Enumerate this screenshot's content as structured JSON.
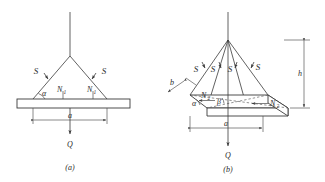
{
  "figure": {
    "background_color": "#ffffff",
    "ink_color": "#3a3a3a",
    "panels": [
      {
        "caption": "(a)",
        "description": "Two-dimensional free body diagram of a plate suspended by two ropes",
        "labels": {
          "tension_left": "S",
          "tension_right": "S",
          "normal_left": "N",
          "normal_left_sub": "1",
          "normal_right": "N",
          "normal_right_sub": "1",
          "angle_alpha": "α",
          "width_dim": "a",
          "weight": "Q"
        }
      },
      {
        "caption": "(b)",
        "description": "Three-dimensional free body diagram of a rectangular slab suspended by four ropes",
        "labels": {
          "tension_1": "S",
          "tension_2": "S",
          "tension_3": "S",
          "tension_4": "S",
          "normal_left": "N",
          "normal_left_sub": "2",
          "normal_right": "N",
          "normal_right_sub": "2",
          "angle_alpha": "α",
          "angle_beta": "β",
          "width_dim": "a",
          "depth_dim": "b",
          "height_dim": "h",
          "weight": "Q"
        }
      }
    ]
  }
}
